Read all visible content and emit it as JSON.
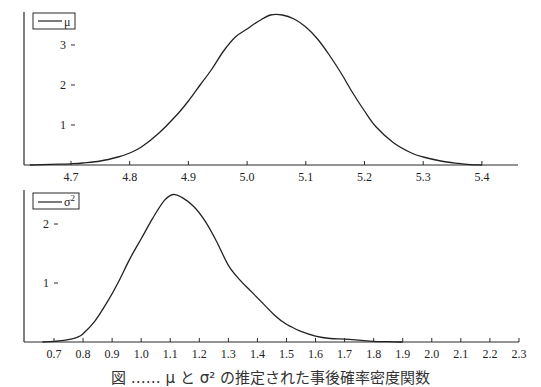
{
  "chart_data": [
    {
      "type": "line",
      "title": "",
      "legend": [
        "μ"
      ],
      "legend_position": "upper-left",
      "xlabel": "",
      "ylabel": "",
      "xlim": [
        4.625,
        5.46
      ],
      "ylim": [
        0,
        3.9
      ],
      "grid": false,
      "x_ticks": [
        "4.7",
        "4.8",
        "4.9",
        "5.0",
        "5.1",
        "5.2",
        "5.3",
        "5.4"
      ],
      "y_ticks": [
        "1",
        "2",
        "3"
      ],
      "series": [
        {
          "name": "μ",
          "x": [
            4.63,
            4.65,
            4.68,
            4.7,
            4.72,
            4.75,
            4.78,
            4.8,
            4.82,
            4.85,
            4.88,
            4.9,
            4.92,
            4.94,
            4.96,
            4.98,
            5.0,
            5.02,
            5.04,
            5.06,
            5.08,
            5.1,
            5.12,
            5.14,
            5.16,
            5.18,
            5.2,
            5.22,
            5.25,
            5.28,
            5.3,
            5.33,
            5.36,
            5.38,
            5.4
          ],
          "values": [
            0.0,
            0.01,
            0.02,
            0.03,
            0.05,
            0.1,
            0.2,
            0.3,
            0.45,
            0.8,
            1.25,
            1.6,
            2.0,
            2.4,
            2.85,
            3.2,
            3.4,
            3.6,
            3.75,
            3.75,
            3.65,
            3.45,
            3.15,
            2.75,
            2.3,
            1.8,
            1.35,
            0.95,
            0.55,
            0.3,
            0.2,
            0.1,
            0.04,
            0.01,
            0.0
          ]
        }
      ]
    },
    {
      "type": "line",
      "title": "",
      "legend": [
        "σ²"
      ],
      "legend_position": "upper-left",
      "xlabel": "",
      "ylabel": "",
      "xlim": [
        0.6,
        2.32
      ],
      "ylim": [
        0,
        2.7
      ],
      "grid": false,
      "x_ticks": [
        "0.7",
        "0.8",
        "0.9",
        "1.0",
        "1.1",
        "1.2",
        "1.3",
        "1.4",
        "1.5",
        "1.6",
        "1.7",
        "1.8",
        "1.9",
        "2.0",
        "2.1",
        "2.2",
        "2.3"
      ],
      "y_ticks": [
        "1",
        "2"
      ],
      "series": [
        {
          "name": "σ²",
          "x": [
            0.66,
            0.7,
            0.74,
            0.78,
            0.8,
            0.84,
            0.88,
            0.92,
            0.96,
            1.0,
            1.04,
            1.08,
            1.11,
            1.14,
            1.18,
            1.22,
            1.26,
            1.3,
            1.34,
            1.38,
            1.42,
            1.46,
            1.5,
            1.55,
            1.6,
            1.65,
            1.7,
            1.75,
            1.8,
            1.85,
            1.9
          ],
          "values": [
            0.0,
            0.01,
            0.03,
            0.08,
            0.14,
            0.35,
            0.65,
            1.0,
            1.4,
            1.75,
            2.1,
            2.4,
            2.5,
            2.45,
            2.3,
            2.05,
            1.7,
            1.3,
            1.05,
            0.85,
            0.65,
            0.45,
            0.3,
            0.18,
            0.1,
            0.06,
            0.05,
            0.03,
            0.01,
            0.005,
            0.0
          ]
        }
      ]
    }
  ],
  "plots": {
    "top": {
      "legend_label": "μ",
      "x_tick_labels": [
        "4.7",
        "4.8",
        "4.9",
        "5.0",
        "5.1",
        "5.2",
        "5.3",
        "5.4"
      ],
      "y_tick_labels": [
        "1",
        "2",
        "3"
      ]
    },
    "bottom": {
      "legend_label": "σ",
      "legend_superscript": "2",
      "x_tick_labels": [
        "0.7",
        "0.8",
        "0.9",
        "1.0",
        "1.1",
        "1.2",
        "1.3",
        "1.4",
        "1.5",
        "1.6",
        "1.7",
        "1.8",
        "1.9",
        "2.0",
        "2.1",
        "2.2",
        "2.3"
      ],
      "y_tick_labels": [
        "1",
        "2"
      ]
    }
  },
  "caption": "図 …… μ と σ² の推定された事後確率密度関数"
}
